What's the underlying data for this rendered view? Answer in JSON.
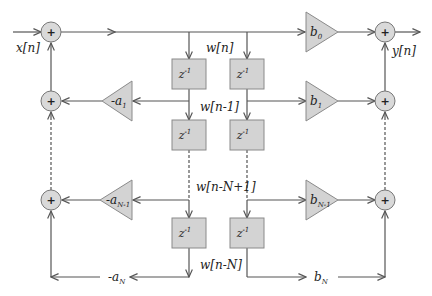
{
  "diagram": {
    "type": "IIR filter, direct form II block diagram",
    "input_label": "x[n]",
    "output_label": "y[n]",
    "adder_symbol": "+",
    "delay_label": "z",
    "delay_exponent": "-1",
    "signals": {
      "w0": "w[n]",
      "w1": "w[n-1]",
      "wN1": "w[n-N+1]",
      "wN": "w[n-N]"
    },
    "feedback_gains": [
      {
        "prefix": "-a",
        "sub": "1"
      },
      {
        "prefix": "-a",
        "sub": "N-1"
      },
      {
        "prefix": "-a",
        "sub": "N"
      }
    ],
    "feedforward_gains": [
      {
        "prefix": "b",
        "sub": "0"
      },
      {
        "prefix": "b",
        "sub": "1"
      },
      {
        "prefix": "b",
        "sub": "N-1"
      },
      {
        "prefix": "b",
        "sub": "N"
      }
    ],
    "colors": {
      "line": "#555555",
      "block_fill": "#d3d3d3",
      "adder_fill": "#d9d9d9",
      "text": "#222222"
    }
  }
}
